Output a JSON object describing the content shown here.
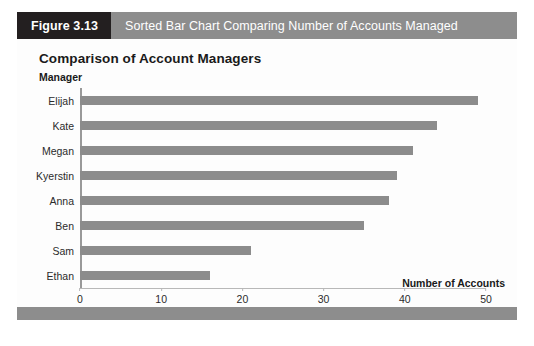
{
  "figure": {
    "number_label": "Figure 3.13",
    "caption": "Sorted Bar Chart Comparing Number of Accounts Managed",
    "header_bg": "#8d8d8d",
    "number_bg": "#231f20",
    "footer_bg": "#8d8d8d"
  },
  "chart_data": {
    "type": "bar",
    "orientation": "horizontal",
    "title": "Comparison of Account Managers",
    "xlabel": "Number of Accounts",
    "ylabel": "Manager",
    "categories": [
      "Elijah",
      "Kate",
      "Megan",
      "Kyerstin",
      "Anna",
      "Ben",
      "Sam",
      "Ethan"
    ],
    "values": [
      49,
      44,
      41,
      39,
      38,
      35,
      21,
      16
    ],
    "xlim": [
      0,
      50
    ],
    "xticks": [
      0,
      10,
      20,
      30,
      40,
      50
    ],
    "xtick_labels": [
      "0",
      "10",
      "20",
      "30",
      "40",
      "50"
    ],
    "grid": false,
    "legend": false,
    "bar_color": "#8c8c8c",
    "axis_color": "#999999"
  }
}
